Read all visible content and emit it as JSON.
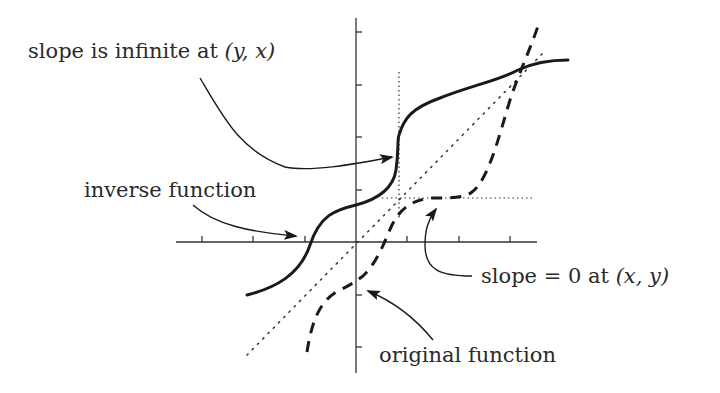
{
  "labels": {
    "slope_infinite": {
      "prefix": "slope is infinite at ",
      "math": "(y, x)"
    },
    "inverse_function": "inverse function",
    "slope_zero": {
      "prefix": "slope = 0 at ",
      "math": "(x, y)"
    },
    "original_function": "original function"
  },
  "colors": {
    "ink": "#1a1a1a",
    "text": "#2a2a2a",
    "background": "#ffffff"
  },
  "axes": {
    "origin": [
      356,
      242
    ],
    "x_range_px": [
      176,
      537
    ],
    "y_range_px": [
      18,
      373
    ],
    "x_ticks_px": [
      202,
      253,
      305,
      407,
      459,
      510
    ],
    "y_ticks_px": [
      32,
      85,
      137,
      190,
      295,
      347
    ]
  },
  "curves": {
    "inverse_function": {
      "style": "solid",
      "description": "f^-1(x), vertical tangent at (y,x)"
    },
    "original_function": {
      "style": "dashed",
      "description": "f(x), horizontal tangent at (x,y)"
    },
    "identity_line": {
      "style": "dotted",
      "description": "y = x reflection line"
    }
  },
  "guides": {
    "vertical_dotted_x": 399,
    "horizontal_dotted_y": 198
  }
}
